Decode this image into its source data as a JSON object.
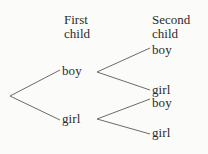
{
  "diagram": {
    "type": "tree",
    "title": "",
    "background_color": "#fbfbf9",
    "text_color": "#2b2b2b",
    "line_color": "#6b6b6b",
    "headers": {
      "first_line1": "First",
      "first_line2": "child",
      "second_line1": "Second",
      "second_line2": "child"
    },
    "level1": [
      {
        "id": "boy",
        "label": "boy"
      },
      {
        "id": "girl",
        "label": "girl"
      }
    ],
    "level2": [
      {
        "id": "boy-boy",
        "parent": "boy",
        "label": "boy"
      },
      {
        "id": "boy-girl",
        "parent": "boy",
        "label": "girl"
      },
      {
        "id": "girl-boy",
        "parent": "girl",
        "label": "boy"
      },
      {
        "id": "girl-girl",
        "parent": "girl",
        "label": "girl"
      }
    ]
  }
}
